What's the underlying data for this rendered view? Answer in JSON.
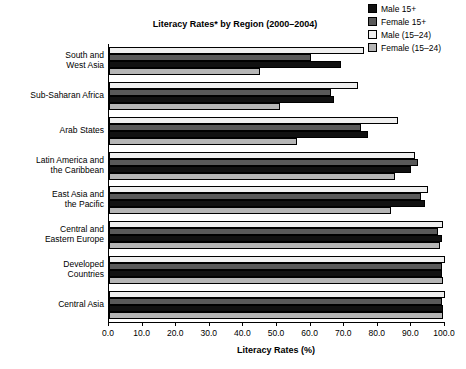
{
  "chart_data": {
    "type": "bar",
    "orientation": "horizontal",
    "title": "Literacy Rates* by Region (2000–2004)",
    "xlabel": "Literacy Rates (%)",
    "ylabel": "",
    "xlim": [
      0.0,
      100.0
    ],
    "xticks": [
      "0.0",
      "10.0",
      "20.0",
      "30.0",
      "40.0",
      "50.0",
      "60.0",
      "70.0",
      "80.0",
      "90.0",
      "100.0"
    ],
    "grid": false,
    "legend_position": "top-right",
    "categories": [
      "South and\nWest Asia",
      "Sub-Saharan Africa",
      "Arab States",
      "Latin America and\nthe Caribbean",
      "East Asia and\nthe Pacific",
      "Central and\nEastern Europe",
      "Developed\nCountries",
      "Central Asia"
    ],
    "series": [
      {
        "name": "Male 15+",
        "color": "#111111",
        "values": [
          69.0,
          67.0,
          77.0,
          90.0,
          94.0,
          99.0,
          99.0,
          99.5
        ]
      },
      {
        "name": "Female 15+",
        "color": "#595959",
        "values": [
          60.0,
          66.0,
          75.0,
          92.0,
          93.0,
          98.0,
          99.0,
          99.0
        ]
      },
      {
        "name": "Male (15–24)",
        "color": "#efefef",
        "values": [
          76.0,
          74.0,
          86.0,
          91.0,
          95.0,
          99.5,
          100.0,
          100.0
        ]
      },
      {
        "name": "Female (15–24)",
        "color": "#b5b5b5",
        "values": [
          45.0,
          51.0,
          56.0,
          85.0,
          84.0,
          98.5,
          99.5,
          99.5
        ]
      }
    ]
  },
  "legend": {
    "items": [
      {
        "label": "Male 15+",
        "color": "#111111"
      },
      {
        "label": "Female 15+",
        "color": "#595959"
      },
      {
        "label": "Male (15–24)",
        "color": "#efefef"
      },
      {
        "label": "Female (15–24)",
        "color": "#b5b5b5"
      }
    ]
  },
  "footnote": {
    "text": ""
  }
}
